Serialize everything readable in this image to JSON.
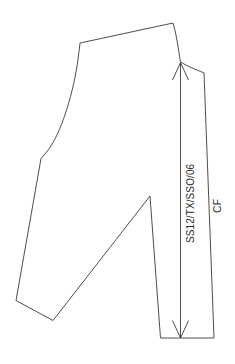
{
  "document": {
    "type": "technical-flat-pattern-drawing",
    "subject": "garment front bodice pattern piece",
    "background_color": "#ffffff",
    "line_color": "#3a3a3a",
    "text_color": "#2b2b2b",
    "canvas": {
      "width": 235,
      "height": 364
    }
  },
  "annotations": {
    "style_code": "SS12/TX/SSO/06",
    "center_front": "CF",
    "style_code_orientation": "vertical-bottom-to-top",
    "center_front_orientation": "vertical-bottom-to-top"
  },
  "dimension_line": {
    "label": "CF",
    "top_arrow": "arrow-up",
    "bottom_arrow": "arrow-down",
    "x": 180,
    "y_top": 62,
    "y_bottom": 338
  },
  "pattern_outline": {
    "description": "Closed pattern piece with shoulder line, neckline curve, center front edge, hem, side seam, armhole S-curve and a V-shaped dart notch",
    "segments": [
      {
        "name": "shoulder-seam",
        "from": [
          80,
          43
        ],
        "to": [
          173,
          23
        ]
      },
      {
        "name": "neckline-curve",
        "from": [
          173,
          23
        ],
        "to": [
          180,
          62
        ]
      },
      {
        "name": "shoulder-tip-to-cf",
        "from": [
          180,
          62
        ],
        "to": [
          204,
          73
        ]
      },
      {
        "name": "center-front-edge",
        "from": [
          204,
          73
        ],
        "to": [
          214,
          338
        ]
      },
      {
        "name": "hem-edge",
        "from": [
          214,
          338
        ],
        "to": [
          160,
          338
        ]
      },
      {
        "name": "dart-right-leg",
        "from": [
          160,
          338
        ],
        "to": [
          150,
          196
        ]
      },
      {
        "name": "dart-left-leg",
        "from": [
          150,
          196
        ],
        "to": [
          53,
          320
        ]
      },
      {
        "name": "lower-hem-left",
        "from": [
          53,
          320
        ],
        "to": [
          16,
          300
        ]
      },
      {
        "name": "side-seam",
        "from": [
          16,
          300
        ],
        "to": [
          41,
          158
        ]
      },
      {
        "name": "underarm-notch",
        "from": [
          41,
          158
        ],
        "to": [
          46,
          152
        ]
      },
      {
        "name": "armhole-curve",
        "from": [
          46,
          152
        ],
        "to": [
          80,
          43
        ]
      }
    ]
  }
}
